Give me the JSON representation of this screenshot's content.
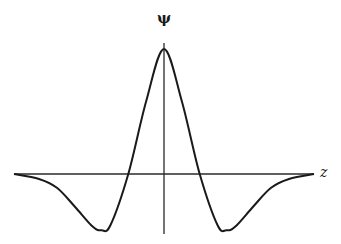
{
  "chart_data": {
    "type": "line",
    "title": "",
    "xlabel": "z",
    "ylabel": "ψ",
    "grid": false,
    "legend": null,
    "x": [
      -4.2,
      -3.5,
      -3.0,
      -2.5,
      -2.0,
      -1.75,
      -1.5,
      -1.0,
      -0.5,
      0,
      0.5,
      1.0,
      1.5,
      1.75,
      2.0,
      2.5,
      3.0,
      3.5,
      4.2
    ],
    "series": [
      {
        "name": "ψ(z)",
        "values": [
          -0.0,
          -0.04,
          -0.11,
          -0.26,
          -0.42,
          -0.45,
          -0.41,
          0.0,
          0.58,
          1.0,
          0.58,
          0.0,
          -0.41,
          -0.45,
          -0.42,
          -0.26,
          -0.11,
          -0.04,
          -0.0
        ]
      }
    ],
    "xlim": [
      -4.2,
      4.2
    ],
    "ylim": [
      -0.5,
      1.06
    ]
  },
  "labels": {
    "y_axis": "ψ",
    "x_axis": "z"
  },
  "style": {
    "curve_color": "#1a1a1a",
    "axis_color": "#2a2a2a"
  }
}
